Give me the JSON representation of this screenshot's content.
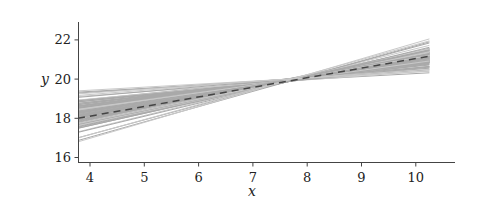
{
  "chart_data": {
    "type": "line",
    "title": "",
    "xlabel": "x",
    "ylabel": "y",
    "xlim": [
      3.78,
      10.3
    ],
    "ylim": [
      15.9,
      22.9
    ],
    "xticks": [
      4,
      5,
      6,
      7,
      8,
      9,
      10
    ],
    "yticks": [
      16,
      18,
      20,
      22
    ],
    "grid": false,
    "legend": null,
    "x_range_of_lines": [
      3.78,
      10.25
    ],
    "series": [
      {
        "name": "posterior regression lines (samples)",
        "style": "solid",
        "color": "#a9a9a9",
        "count": 100,
        "envelope_upper": [
          [
            3.78,
            19.4
          ],
          [
            7.2,
            19.75
          ],
          [
            10.25,
            22.05
          ]
        ],
        "envelope_lower": [
          [
            3.78,
            16.8
          ],
          [
            7.2,
            19.45
          ],
          [
            10.25,
            20.3
          ]
        ],
        "pivot": [
          7.2,
          19.6
        ]
      },
      {
        "name": "mean regression line",
        "style": "dashed",
        "color": "#444444",
        "points": [
          [
            3.78,
            18.0
          ],
          [
            7.0,
            19.56
          ],
          [
            10.25,
            21.2
          ]
        ],
        "intercept": 16.15,
        "slope": 0.49
      }
    ]
  },
  "colors": {
    "band": "#a9a9a9",
    "band_light": "#c9c9c9",
    "mean": "#444444",
    "axis": "#444444",
    "background": "#ffffff"
  }
}
